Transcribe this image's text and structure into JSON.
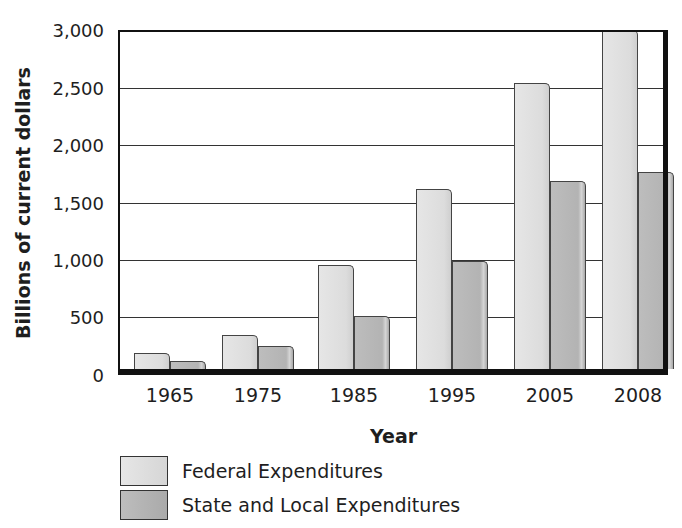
{
  "chart_data": {
    "type": "bar",
    "title": "",
    "xlabel": "Year",
    "ylabel": "Billions of current dollars",
    "categories": [
      "1965",
      "1975",
      "1985",
      "1995",
      "2005",
      "2008"
    ],
    "series": [
      {
        "name": "Federal Expenditures",
        "color": "#dedede",
        "values": [
          140,
          300,
          920,
          1590,
          2530,
          3000
        ]
      },
      {
        "name": "State and Local Expenditures",
        "color": "#b5b5b5",
        "values": [
          70,
          205,
          470,
          960,
          1660,
          1740
        ]
      }
    ],
    "ylim": [
      0,
      3000
    ],
    "yticks": [
      "0",
      "500",
      "1,000",
      "1,500",
      "2,000",
      "2,500",
      "3,000"
    ],
    "grid": true,
    "legend_position": "bottom-left"
  }
}
